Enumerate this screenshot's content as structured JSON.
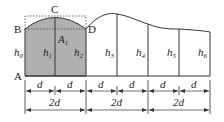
{
  "diagram": {
    "point_labels": {
      "A": "A",
      "B": "B",
      "C": "C",
      "D": "D"
    },
    "area_label": {
      "base": "A",
      "sub": "1"
    },
    "heights": [
      {
        "base": "h",
        "sub": "0"
      },
      {
        "base": "h",
        "sub": "1"
      },
      {
        "base": "h",
        "sub": "2"
      },
      {
        "base": "h",
        "sub": "3"
      },
      {
        "base": "h",
        "sub": "4"
      },
      {
        "base": "h",
        "sub": "5"
      },
      {
        "base": "h",
        "sub": "6"
      }
    ],
    "dimension_row1": [
      "d",
      "d",
      "d",
      "d",
      "d",
      "d"
    ],
    "dimension_row2": [
      "2d",
      "2d",
      "2d"
    ],
    "colors": {
      "shade": "#b0b0b0",
      "line": "#333333"
    }
  }
}
